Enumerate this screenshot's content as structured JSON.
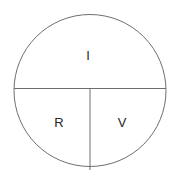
{
  "diagram": {
    "shape": "circle",
    "background_color": "#ffffff",
    "stroke_color": "#6e6e6e",
    "stroke_width": 1,
    "text_color": "#262626",
    "center": {
      "x": 90,
      "y": 90.5
    },
    "radius": 76,
    "dividers": [
      {
        "name": "horizontal-diameter",
        "from_x": 14,
        "from_y": 88.5,
        "to_x": 166,
        "to_y": 88.5
      },
      {
        "name": "vertical-radius",
        "from_x": 90,
        "from_y": 88.5,
        "to_x": 90,
        "to_y": 170
      }
    ],
    "sectors": [
      {
        "id": "top",
        "label": "I",
        "label_x": 88,
        "label_y": 57,
        "meaning": "current"
      },
      {
        "id": "bottom-left",
        "label": "R",
        "label_x": 59,
        "label_y": 124,
        "meaning": "resistance"
      },
      {
        "id": "bottom-right",
        "label": "V",
        "label_x": 122,
        "label_y": 124,
        "meaning": "voltage"
      }
    ]
  }
}
